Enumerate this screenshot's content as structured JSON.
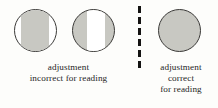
{
  "figure": {
    "name": "lens-adjustment-comparison",
    "background_color": "#fdfdfb",
    "outline_color": "#3b3a38",
    "shaded_color": "#c8c8c2",
    "clear_color": "#ffffff",
    "divider_color": "#141312",
    "text_color": "#26251f"
  },
  "circles": [
    {
      "id": "circle-1",
      "label": "lens-diagram-left",
      "fill": "#ffffff",
      "bands": [
        {
          "name": "shaded-band",
          "color": "#c8c8c2",
          "left_px": 6,
          "width_px": 28
        }
      ]
    },
    {
      "id": "circle-2",
      "label": "lens-diagram-middle",
      "fill": "#c8c8c2",
      "bands": [
        {
          "name": "clear-band",
          "color": "#ffffff",
          "left_px": 14,
          "width_px": 18
        }
      ]
    },
    {
      "id": "circle-3",
      "label": "lens-diagram-right",
      "fill": "#c8c8c2",
      "bands": []
    }
  ],
  "divider": {
    "name": "dashed-vertical-divider",
    "style": "dashed",
    "dash_count": 6,
    "color": "#141312"
  },
  "captions": {
    "left": {
      "lines": [
        "adjustment",
        "incorrect for reading"
      ]
    },
    "right": {
      "lines": [
        "adjustment",
        "correct",
        "for reading"
      ]
    }
  }
}
